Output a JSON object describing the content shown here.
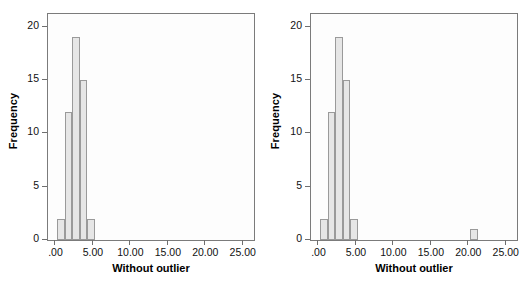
{
  "figure": {
    "width": 525,
    "height": 285,
    "background": "#ffffff",
    "panel_count": 2
  },
  "style": {
    "bar_fill": "#e6e6e6",
    "bar_stroke": "#9a9a9a",
    "frame_stroke": "#7b7b7b",
    "plot_background": "#fdfdfd",
    "tick_color": "#6f6f6f",
    "text_color": "#111111"
  },
  "chart_data": [
    {
      "type": "bar",
      "title": "",
      "subtitle": "",
      "xlabel": "Without outlier",
      "ylabel": "Frequency",
      "xlim": [
        -1.0,
        26.5
      ],
      "ylim": [
        0,
        21.2
      ],
      "xticks": [
        0,
        5,
        10,
        15,
        20,
        25
      ],
      "xticklabels": [
        ".00",
        "5.00",
        "10.00",
        "15.00",
        "20.00",
        "25.00"
      ],
      "yticks": [
        0,
        5,
        10,
        15,
        20
      ],
      "yticklabels": [
        "0",
        "5",
        "10",
        "15",
        "20"
      ],
      "grid": false,
      "legend": "none",
      "bin_width": 1,
      "bins": [
        {
          "left": 0.25,
          "right": 1.25,
          "value": 2
        },
        {
          "left": 1.25,
          "right": 2.25,
          "value": 12
        },
        {
          "left": 2.25,
          "right": 3.25,
          "value": 19
        },
        {
          "left": 3.25,
          "right": 4.25,
          "value": 15
        },
        {
          "left": 4.25,
          "right": 5.25,
          "value": 2
        }
      ],
      "categories": [
        "0.25-1.25",
        "1.25-2.25",
        "2.25-3.25",
        "3.25-4.25",
        "4.25-5.25"
      ],
      "values": [
        2,
        12,
        19,
        15,
        2
      ]
    },
    {
      "type": "bar",
      "title": "",
      "subtitle": "",
      "xlabel": "Without outlier",
      "ylabel": "Frequency",
      "xlim": [
        -1.0,
        26.5
      ],
      "ylim": [
        0,
        21.2
      ],
      "xticks": [
        0,
        5,
        10,
        15,
        20,
        25
      ],
      "xticklabels": [
        ".00",
        "5.00",
        "10.00",
        "15.00",
        "20.00",
        "25.00"
      ],
      "yticks": [
        0,
        5,
        10,
        15,
        20
      ],
      "yticklabels": [
        "0",
        "5",
        "10",
        "15",
        "20"
      ],
      "grid": false,
      "legend": "none",
      "bin_width": 1,
      "bins": [
        {
          "left": 0.25,
          "right": 1.25,
          "value": 2
        },
        {
          "left": 1.25,
          "right": 2.25,
          "value": 12
        },
        {
          "left": 2.25,
          "right": 3.25,
          "value": 19
        },
        {
          "left": 3.25,
          "right": 4.25,
          "value": 15
        },
        {
          "left": 4.25,
          "right": 5.25,
          "value": 2
        },
        {
          "left": 20.25,
          "right": 21.25,
          "value": 1
        }
      ],
      "categories": [
        "0.25-1.25",
        "1.25-2.25",
        "2.25-3.25",
        "3.25-4.25",
        "4.25-5.25",
        "20.25-21.25"
      ],
      "values": [
        2,
        12,
        19,
        15,
        2,
        1
      ]
    }
  ]
}
